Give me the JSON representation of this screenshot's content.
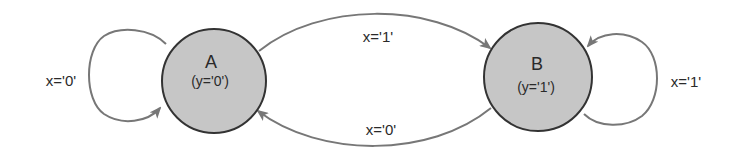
{
  "diagram": {
    "type": "moore-state-machine",
    "colors": {
      "state_fill": "#c6c6c6",
      "state_stroke": "#333333",
      "edge_stroke": "#777777",
      "text": "#2a2a2a",
      "background": "#ffffff"
    },
    "states": [
      {
        "id": "A",
        "name": "A",
        "output": "(y='0')"
      },
      {
        "id": "B",
        "name": "B",
        "output": "(y='1')"
      }
    ],
    "transitions": [
      {
        "from": "A",
        "to": "A",
        "label": "x='0'"
      },
      {
        "from": "A",
        "to": "B",
        "label": "x='1'"
      },
      {
        "from": "B",
        "to": "A",
        "label": "x='0'"
      },
      {
        "from": "B",
        "to": "B",
        "label": "x='1'"
      }
    ]
  }
}
